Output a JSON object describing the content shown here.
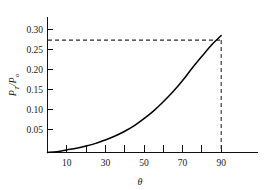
{
  "chart_data": {
    "type": "line",
    "title": "",
    "subtitle": "",
    "xlabel": "θ",
    "ylabel": "P_T/P_o",
    "ylabel_parts": {
      "numerator": "P",
      "numerator_sub": "T",
      "separator": "/",
      "denominator": "P",
      "denominator_sub": "o"
    },
    "xlim": [
      0,
      100
    ],
    "ylim": [
      0,
      0.315
    ],
    "grid": false,
    "legend": null,
    "x_tick_values": [
      10,
      20,
      30,
      40,
      50,
      60,
      70,
      80,
      90
    ],
    "x_tick_labels": [
      "10",
      "",
      "30",
      "",
      "50",
      "",
      "70",
      "",
      "90"
    ],
    "x_labeled_values": [
      10,
      30,
      50,
      70,
      90
    ],
    "y_tick_values": [
      0.05,
      0.1,
      0.15,
      0.2,
      0.25,
      0.3
    ],
    "y_tick_labels": [
      "0.05",
      "0.10",
      "0.15",
      "0.20",
      "0.25",
      "0.30"
    ],
    "x": [
      0,
      5,
      10,
      15,
      20,
      25,
      30,
      35,
      40,
      45,
      50,
      55,
      60,
      65,
      70,
      75,
      80,
      85,
      90
    ],
    "y": [
      0.0,
      0.002,
      0.006,
      0.01,
      0.015,
      0.021,
      0.029,
      0.038,
      0.049,
      0.062,
      0.078,
      0.096,
      0.117,
      0.14,
      0.166,
      0.195,
      0.222,
      0.248,
      0.27
    ],
    "series": [
      {
        "name": "P_T/P_o",
        "values": [
          0.0,
          0.002,
          0.006,
          0.01,
          0.015,
          0.021,
          0.029,
          0.038,
          0.049,
          0.062,
          0.078,
          0.096,
          0.117,
          0.14,
          0.166,
          0.195,
          0.222,
          0.248,
          0.27
        ],
        "color": "#000000"
      }
    ],
    "annotations": [
      {
        "name": "endpoint-horizontal-guide",
        "type": "horizontal-dashed-line",
        "y": 0.27,
        "x_from": 0,
        "x_to": 90
      },
      {
        "name": "endpoint-vertical-guide",
        "type": "vertical-dashed-line",
        "x": 90,
        "y_from": 0,
        "y_to": 0.27
      }
    ],
    "endpoint": {
      "x": 90,
      "y": 0.27
    },
    "colors": {
      "curve": "#000000",
      "axis": "#111111",
      "guide": "#2b2b2b",
      "background": "#ffffff",
      "text": "#1a1a1a"
    }
  }
}
